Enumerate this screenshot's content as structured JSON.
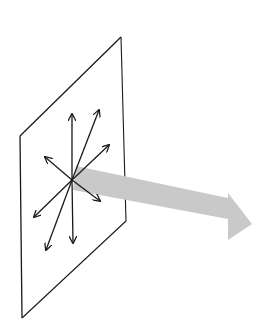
{
  "diagram": {
    "colors": {
      "background": "#ffffff",
      "lines": "#1a1a1a",
      "beam": "#c9c9c9"
    },
    "plane": {
      "points": "20,136 121,37 126,221 22,318"
    },
    "center": [
      72,
      180
    ],
    "vectors": [
      {
        "name": "up",
        "tip": [
          72,
          114
        ]
      },
      {
        "name": "up-right",
        "tip": [
          99,
          110
        ]
      },
      {
        "name": "right-upper",
        "tip": [
          109,
          145
        ]
      },
      {
        "name": "upper-left",
        "tip": [
          45,
          157
        ]
      },
      {
        "name": "lower-right",
        "tip": [
          100,
          201
        ]
      },
      {
        "name": "lower-left",
        "tip": [
          34,
          217
        ]
      },
      {
        "name": "down",
        "tip": [
          73,
          243
        ]
      },
      {
        "name": "down-left",
        "tip": [
          46,
          250
        ]
      }
    ],
    "beam": {
      "points": "76,166 228,198 228,193 252,224 228,240 228,219 73,190"
    }
  }
}
